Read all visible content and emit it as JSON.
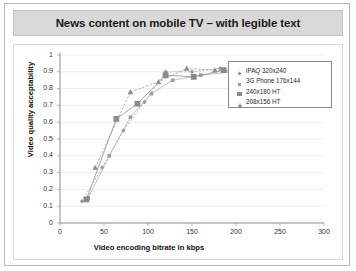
{
  "slide": {
    "title": "News content on mobile TV – with legible text"
  },
  "legend": {
    "items": [
      {
        "label": "iPAQ 320x240",
        "marker": "diamond-marker"
      },
      {
        "label": "3G Phone 176x144",
        "marker": "small-square-marker"
      },
      {
        "label": "240x180 HT",
        "marker": "large-square-marker"
      },
      {
        "label": "208x156 HT",
        "marker": "triangle-marker"
      }
    ]
  },
  "chart_data": {
    "type": "scatter",
    "title": "News content on mobile TV – with legible text",
    "xlabel": "Video encoding bitrate in kbps",
    "ylabel": "Video quality acceptability",
    "xlim": [
      0,
      300
    ],
    "ylim": [
      0,
      1
    ],
    "xticks": [
      0,
      50,
      100,
      150,
      200,
      250,
      300
    ],
    "yticks": [
      0,
      0.1,
      0.2,
      0.3,
      0.4,
      0.5,
      0.6,
      0.7,
      0.8,
      0.9,
      1
    ],
    "grid": true,
    "legend_position": "top-right",
    "series": [
      {
        "name": "iPAQ 320x240",
        "marker": "diamond-marker",
        "color": "#9a9a9a",
        "points": [
          {
            "x": 25,
            "y": 0.13
          },
          {
            "x": 48,
            "y": 0.33
          },
          {
            "x": 72,
            "y": 0.55
          },
          {
            "x": 96,
            "y": 0.72
          },
          {
            "x": 120,
            "y": 0.9
          },
          {
            "x": 150,
            "y": 0.9
          },
          {
            "x": 182,
            "y": 0.92
          },
          {
            "x": 210,
            "y": 0.91
          },
          {
            "x": 232,
            "y": 0.9
          }
        ]
      },
      {
        "name": "3G Phone 176x144",
        "marker": "small-square-marker",
        "color": "#9e9e9e",
        "points": [
          {
            "x": 32,
            "y": 0.15
          },
          {
            "x": 56,
            "y": 0.4
          },
          {
            "x": 80,
            "y": 0.63
          },
          {
            "x": 104,
            "y": 0.77
          },
          {
            "x": 128,
            "y": 0.85
          },
          {
            "x": 160,
            "y": 0.88
          },
          {
            "x": 196,
            "y": 0.9
          },
          {
            "x": 224,
            "y": 0.88
          }
        ]
      },
      {
        "name": "240x180 HT",
        "marker": "large-square-marker",
        "color": "#8a8a8a",
        "points": [
          {
            "x": 30,
            "y": 0.14
          },
          {
            "x": 64,
            "y": 0.62
          },
          {
            "x": 88,
            "y": 0.71
          },
          {
            "x": 120,
            "y": 0.88
          },
          {
            "x": 152,
            "y": 0.87
          },
          {
            "x": 186,
            "y": 0.91
          },
          {
            "x": 212,
            "y": 0.89
          }
        ]
      },
      {
        "name": "208x156 HT",
        "marker": "triangle-marker",
        "color": "#8f8f8f",
        "points": [
          {
            "x": 40,
            "y": 0.33
          },
          {
            "x": 80,
            "y": 0.78
          },
          {
            "x": 112,
            "y": 0.84
          },
          {
            "x": 144,
            "y": 0.92
          },
          {
            "x": 176,
            "y": 0.91
          },
          {
            "x": 212,
            "y": 0.88
          }
        ]
      }
    ]
  }
}
